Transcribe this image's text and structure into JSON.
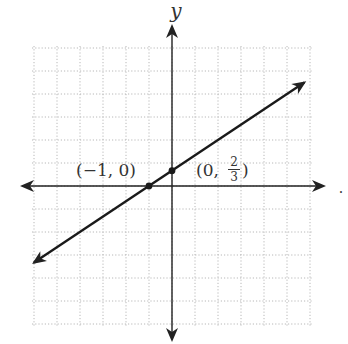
{
  "chart_data": {
    "type": "line",
    "title": "",
    "xlabel": "x",
    "ylabel": "y",
    "xlim": [
      -6,
      6
    ],
    "ylim": [
      -6,
      6
    ],
    "grid": true,
    "grid_style": "dotted",
    "series": [
      {
        "name": "line",
        "equation": "y = (2/3)x + 2/3",
        "slope": 0.6667,
        "intercept": 0.6667,
        "x": [
          -6,
          5.75
        ],
        "y": [
          -3.33,
          4.5
        ],
        "arrows": "both"
      }
    ],
    "points": [
      {
        "x": -1,
        "y": 0,
        "label": "(−1, 0)"
      },
      {
        "x": 0,
        "y": 0.6667,
        "label_prefix": "(0,",
        "label_num": "2",
        "label_den": "3",
        "label_suffix": ")"
      }
    ]
  },
  "axes": {
    "y_label": "y",
    "x_label": ".",
    "axis_color": "#222222",
    "grid_color": "#b8b8b8",
    "line_color": "#1a1a1a"
  }
}
